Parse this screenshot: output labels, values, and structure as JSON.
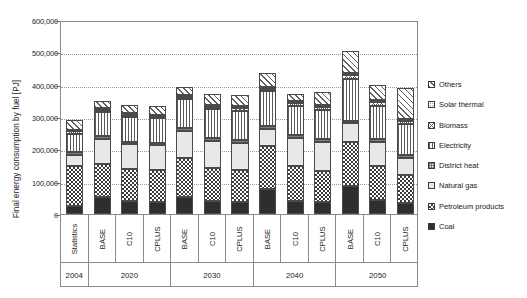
{
  "chart_data": {
    "type": "bar",
    "stacked": true,
    "title": "",
    "xlabel": "",
    "ylabel": "Final energy consumption by fuel [PJ]",
    "ylim": [
      0,
      600000
    ],
    "ytick_labels": [
      "600,000",
      "500,000",
      "400,000",
      "300,000",
      "200,000",
      "100,000",
      "0"
    ],
    "ytick_values": [
      600000,
      500000,
      400000,
      300000,
      200000,
      100000,
      0
    ],
    "grid": true,
    "legend_position": "right",
    "categories": [
      "Statistics",
      "BASE",
      "C10",
      "CPLUS",
      "BASE",
      "C10",
      "CPLUS",
      "BASE",
      "C10",
      "CPLUS",
      "BASE",
      "C10",
      "CPLUS"
    ],
    "group_labels": [
      "2004",
      "2020",
      "2030",
      "2040",
      "2050"
    ],
    "group_sizes": [
      1,
      3,
      3,
      3,
      3
    ],
    "series": [
      {
        "name": "Coal",
        "pattern": "solid-black",
        "values": [
          24000,
          52000,
          40000,
          38000,
          54000,
          40000,
          37000,
          76000,
          41000,
          36000,
          86000,
          42000,
          34000
        ]
      },
      {
        "name": "Petroleum products",
        "pattern": "checkerboard",
        "values": [
          126000,
          103000,
          100000,
          98000,
          118000,
          103000,
          100000,
          134000,
          106000,
          96000,
          136000,
          108000,
          88000
        ]
      },
      {
        "name": "Natural gas",
        "pattern": "light-gray",
        "values": [
          34000,
          78000,
          76000,
          76000,
          86000,
          84000,
          84000,
          52000,
          88000,
          90000,
          58000,
          74000,
          52000
        ]
      },
      {
        "name": "District heat",
        "pattern": "fine-grid",
        "values": [
          9000,
          8000,
          8000,
          8000,
          9000,
          9000,
          9000,
          9000,
          9000,
          9000,
          9000,
          9000,
          9000
        ]
      },
      {
        "name": "Electricity",
        "pattern": "vertical-lines",
        "values": [
          56000,
          75000,
          76000,
          76000,
          88000,
          88000,
          90000,
          108000,
          90000,
          92000,
          130000,
          102000,
          94000
        ]
      },
      {
        "name": "Biomass",
        "pattern": "cross-hatch",
        "values": [
          8000,
          7000,
          7000,
          7000,
          8000,
          8000,
          8000,
          9000,
          9000,
          9000,
          10000,
          10000,
          10000
        ]
      },
      {
        "name": "Solar thermal",
        "pattern": "dotted",
        "values": [
          3000,
          4000,
          4000,
          4000,
          5000,
          5000,
          5000,
          6000,
          6000,
          6000,
          8000,
          8000,
          8000
        ]
      },
      {
        "name": "Others",
        "pattern": "diagonal-hatch",
        "values": [
          30000,
          23000,
          25000,
          27000,
          24000,
          33000,
          35000,
          41000,
          21000,
          38000,
          68000,
          45000,
          95000
        ]
      }
    ],
    "totals": [
      290000,
      350000,
      336000,
      334000,
      392000,
      370000,
      368000,
      435000,
      370000,
      376000,
      505000,
      398000,
      390000
    ]
  },
  "legend": {
    "items": [
      {
        "label": "Others",
        "pattern": "diagonal-hatch"
      },
      {
        "label": "Solar thermal",
        "pattern": "dotted"
      },
      {
        "label": "Biomass",
        "pattern": "cross-hatch"
      },
      {
        "label": "Electricity",
        "pattern": "vertical-lines"
      },
      {
        "label": "District heat",
        "pattern": "fine-grid"
      },
      {
        "label": "Natural gas",
        "pattern": "light-gray"
      },
      {
        "label": "Petroleum products",
        "pattern": "checkerboard"
      },
      {
        "label": "Coal",
        "pattern": "solid-black"
      }
    ]
  }
}
